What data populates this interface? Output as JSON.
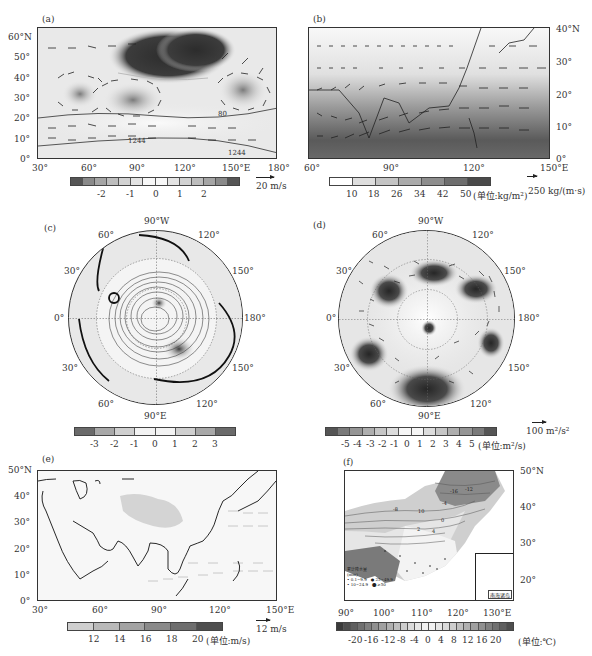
{
  "figure": {
    "panels": [
      {
        "id": "a",
        "label": "(a)",
        "x_ticks": [
          "30°",
          "60°",
          "90°",
          "120°",
          "150°E",
          "180°"
        ],
        "y_ticks": [
          "60°N",
          "50°",
          "40°",
          "30°",
          "20°",
          "10°",
          "0°"
        ],
        "contour_labels": [
          "1244",
          "80",
          "1244"
        ],
        "colorbar_ticks": [
          "-2",
          "-1",
          "0",
          "1",
          "2"
        ],
        "colorbar_colors": [
          "#555555",
          "#8a8a8a",
          "#a5a5a5",
          "#bdbdbd",
          "#d2d2d2",
          "#e3e3e3",
          "#f7f7f7",
          "#f7f7f7",
          "#e3e3e3",
          "#d2d2d2",
          "#bdbdbd",
          "#a5a5a5",
          "#8a8a8a",
          "#555555"
        ],
        "ref_vector": "20 m/s"
      },
      {
        "id": "b",
        "label": "(b)",
        "x_ticks": [
          "60°",
          "90°",
          "120°",
          "150°E"
        ],
        "y_ticks": [
          "40°N",
          "30°",
          "20°",
          "10°",
          "0°"
        ],
        "colorbar_ticks": [
          "10",
          "18",
          "26",
          "34",
          "42",
          "50"
        ],
        "colorbar_unit": "(单位:kg/m²)",
        "colorbar_colors": [
          "#ffffff",
          "#dedede",
          "#c4c4c4",
          "#ababab",
          "#8e8e8e",
          "#6e6e6e",
          "#4a4a4a"
        ],
        "ref_vector": "250 kg/(m·s)"
      },
      {
        "id": "c",
        "label": "(c)",
        "lon_labels": {
          "top": "90°W",
          "bottom": "90°E",
          "left": "0°",
          "right": "180°",
          "upper_left_1": "60°",
          "upper_left_2": "30°",
          "upper_right_1": "120°",
          "upper_right_2": "150°",
          "lower_left_1": "30°",
          "lower_left_2": "60°",
          "lower_right_1": "150°",
          "lower_right_2": "120°"
        },
        "colorbar_ticks": [
          "-3",
          "-2",
          "-1",
          "0",
          "1",
          "2",
          "3"
        ],
        "colorbar_colors": [
          "#6a6a6a",
          "#a8a8a8",
          "#cfcfcf",
          "#f2f2f2",
          "#f2f2f2",
          "#cfcfcf",
          "#a8a8a8",
          "#6a6a6a"
        ]
      },
      {
        "id": "d",
        "label": "(d)",
        "lon_labels": {
          "top": "90°W",
          "bottom": "90°E",
          "left": "0°",
          "right": "180°",
          "upper_left_1": "60°",
          "upper_left_2": "30°",
          "upper_right_1": "120°",
          "upper_right_2": "150°",
          "lower_left_1": "30°",
          "lower_left_2": "60°",
          "lower_right_1": "150°",
          "lower_right_2": "120°"
        },
        "colorbar_ticks": [
          "-5",
          "-4",
          "-3",
          "-2",
          "-1",
          "0",
          "1",
          "2",
          "3",
          "4",
          "5"
        ],
        "colorbar_unit": "(单位:m²/s)",
        "colorbar_colors": [
          "#555555",
          "#7a7a7a",
          "#959595",
          "#aeaeae",
          "#c6c6c6",
          "#dcdcdc",
          "#f5f5f5",
          "#f5f5f5",
          "#dcdcdc",
          "#c6c6c6",
          "#aeaeae",
          "#959595",
          "#7a7a7a",
          "#555555"
        ],
        "ref_vector": "100 m²/s²"
      },
      {
        "id": "e",
        "label": "(e)",
        "x_ticks": [
          "30°",
          "60°",
          "90°",
          "120°",
          "150°E"
        ],
        "y_ticks": [
          "50°N",
          "40°",
          "30°",
          "20°",
          "10°",
          "0°"
        ],
        "colorbar_ticks": [
          "12",
          "14",
          "16",
          "18",
          "20"
        ],
        "colorbar_unit": "(单位:m/s)",
        "colorbar_colors": [
          "#cfcfcf",
          "#b9b9b9",
          "#a3a3a3",
          "#8a8a8a",
          "#6e6e6e",
          "#4e4e4e"
        ],
        "ref_vector": "12 m/s"
      },
      {
        "id": "f",
        "label": "(f)",
        "x_ticks": [
          "90°",
          "100°",
          "110°",
          "120°",
          "130°E"
        ],
        "y_ticks": [
          "50°N",
          "40°",
          "30°",
          "20°"
        ],
        "contour_labels": [
          "-16",
          "-12",
          "-8",
          "-4",
          "0",
          "2",
          "4",
          "10"
        ],
        "inset_label": "南海诸岛",
        "legend_title": "累计降水量",
        "legend_unit": "(mm)",
        "legend_items": [
          "0.1~9.9",
          "10~24.9",
          "25~49.9",
          "≥50"
        ],
        "colorbar_ticks": [
          "-20",
          "-16",
          "-12",
          "-8",
          "-4",
          "0",
          "4",
          "8",
          "12",
          "16",
          "20"
        ],
        "colorbar_unit": "(单位:℃)",
        "colorbar_colors": [
          "#3a3a3a",
          "#4e4e4e",
          "#5f5f5f",
          "#707070",
          "#808080",
          "#909090",
          "#a0a0a0",
          "#b0b0b0",
          "#bfbfbf",
          "#cdcdcd",
          "#dadada",
          "#e6e6e6",
          "#f1f1f1",
          "#f1f1f1",
          "#e6e6e6",
          "#dadada",
          "#cdcdcd",
          "#bfbfbf",
          "#b0b0b0",
          "#a0a0a0",
          "#909090",
          "#808080",
          "#707070",
          "#5f5f5f",
          "#4e4e4e"
        ]
      }
    ]
  },
  "chart_data": [
    {
      "type": "heatmap",
      "title": "(a)",
      "description": "Map 30°E–180°, 0°–65°N: shaded anomaly with wind vectors and contours",
      "xlabel": "Longitude",
      "ylabel": "Latitude",
      "x_ticks": [
        "30°",
        "60°",
        "90°",
        "120°",
        "150°E",
        "180°"
      ],
      "y_ticks": [
        "0°",
        "10°",
        "20°",
        "30°",
        "40°",
        "50°",
        "60°N"
      ],
      "xlim": [
        30,
        180
      ],
      "ylim": [
        0,
        65
      ],
      "colorbar": {
        "ticks": [
          -2,
          -1,
          0,
          1,
          2
        ],
        "range": [
          -3,
          3
        ]
      },
      "contour_labels": [
        1244,
        80,
        1244
      ],
      "reference_vector": "20 m/s",
      "features": [
        {
          "kind": "strong negative center",
          "lon": [
            80,
            130
          ],
          "lat": [
            42,
            63
          ]
        },
        {
          "kind": "negative center",
          "lon": [
            50,
            65
          ],
          "lat": [
            28,
            36
          ]
        },
        {
          "kind": "negative center",
          "lon": [
            80,
            100
          ],
          "lat": [
            24,
            34
          ]
        },
        {
          "kind": "negative center",
          "lon": [
            145,
            165
          ],
          "lat": [
            28,
            38
          ]
        }
      ]
    },
    {
      "type": "heatmap",
      "title": "(b)",
      "description": "Map 60°E–150°E, 0°–40°N: precipitable water shading with moisture flux vectors",
      "x_ticks": [
        "60°",
        "90°",
        "120°",
        "150°E"
      ],
      "y_ticks": [
        "0°",
        "10°",
        "20°",
        "30°",
        "40°N"
      ],
      "xlim": [
        60,
        150
      ],
      "ylim": [
        0,
        40
      ],
      "colorbar": {
        "ticks": [
          10,
          18,
          26,
          34,
          42,
          50
        ],
        "unit": "kg/m²"
      },
      "reference_vector": "250 kg/(m·s)"
    },
    {
      "type": "heatmap",
      "title": "(c)",
      "description": "Northern Hemisphere polar stereographic: shaded anomaly with geopotential contours and thick line",
      "lon_labels": [
        "0°",
        "30°",
        "60°",
        "90°W",
        "120°",
        "150°",
        "180°",
        "150°",
        "120°",
        "90°E",
        "60°",
        "30°"
      ],
      "colorbar": {
        "ticks": [
          -3,
          -2,
          -1,
          0,
          1,
          2,
          3
        ]
      }
    },
    {
      "type": "heatmap",
      "title": "(d)",
      "description": "Northern Hemisphere polar stereographic: wave activity flux vectors with streamfunction anomaly shading",
      "lon_labels": [
        "0°",
        "30°",
        "60°",
        "90°W",
        "120°",
        "150°",
        "180°",
        "150°",
        "120°",
        "90°E",
        "60°",
        "30°"
      ],
      "colorbar": {
        "ticks": [
          -5,
          -4,
          -3,
          -2,
          -1,
          0,
          1,
          2,
          3,
          4,
          5
        ],
        "unit": "m²/s"
      },
      "reference_vector": "100 m²/s²"
    },
    {
      "type": "heatmap",
      "title": "(e)",
      "description": "Map 30°E–150°E, 0°–50°N: wind speed shading with wind vectors",
      "x_ticks": [
        "30°",
        "60°",
        "90°",
        "120°",
        "150°E"
      ],
      "y_ticks": [
        "0°",
        "10°",
        "20°",
        "30°",
        "40°",
        "50°N"
      ],
      "xlim": [
        30,
        150
      ],
      "ylim": [
        0,
        50
      ],
      "colorbar": {
        "ticks": [
          12,
          14,
          16,
          18,
          20
        ],
        "unit": "m/s"
      },
      "reference_vector": "12 m/s"
    },
    {
      "type": "heatmap",
      "title": "(f)",
      "description": "China map 90°E–135°E, 15°–50°N: temperature shading/contours with accumulated precipitation dots",
      "x_ticks": [
        "90°",
        "100°",
        "110°",
        "120°",
        "130°E"
      ],
      "y_ticks": [
        "20°",
        "30°",
        "40°",
        "50°N"
      ],
      "xlim": [
        90,
        135
      ],
      "ylim": [
        15,
        50
      ],
      "colorbar": {
        "ticks": [
          -20,
          -16,
          -12,
          -8,
          -4,
          0,
          4,
          8,
          12,
          16,
          20
        ],
        "unit": "℃"
      },
      "legend": {
        "title": "累计降水量 (mm)",
        "items": [
          "0.1~9.9",
          "10~24.9",
          "25~49.9",
          "≥50"
        ]
      },
      "inset": "南海诸岛"
    }
  ]
}
